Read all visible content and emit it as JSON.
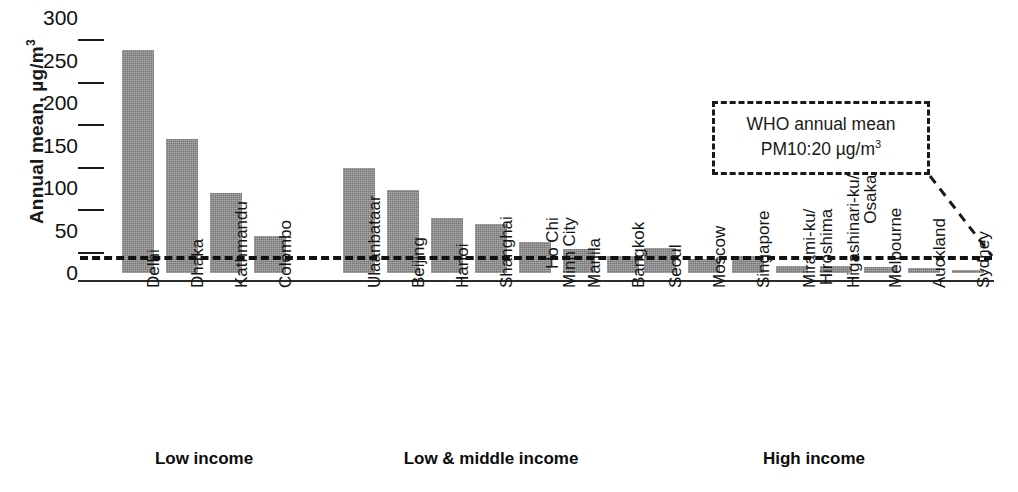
{
  "chart_data": {
    "type": "bar",
    "title": "",
    "xlabel": "",
    "ylabel": "Annual mean, µg/m",
    "ylabel_sup": "3",
    "ylim": [
      0,
      300
    ],
    "yticks": [
      0,
      50,
      100,
      150,
      200,
      250,
      300
    ],
    "grid": false,
    "legend": "none",
    "categories": [
      "Delhi",
      "Dhaka",
      "Kathmandu",
      "Colombo",
      "Ulaanbataar",
      "Beijing",
      "Hanoi",
      "Shanghai",
      "Ho Chi\nMinh City",
      "Manila",
      "Bangkok",
      "Seoul",
      "Moscow",
      "Singapore",
      "Mirami-ku/\nHiroshima",
      "Higashinari-ku/\nOsaka",
      "Melbourne",
      "Auckland",
      "Sydney"
    ],
    "values": [
      262,
      158,
      94,
      44,
      124,
      98,
      65,
      58,
      36,
      28,
      20,
      30,
      16,
      20,
      8,
      8,
      7,
      6,
      3
    ],
    "bar_color": "#919191",
    "groups": [
      {
        "label": "Low income",
        "start": 0,
        "count": 4
      },
      {
        "label": "Low & middle income",
        "start": 4,
        "count": 7
      },
      {
        "label": "High income",
        "start": 11,
        "count": 8
      }
    ],
    "annotations": [
      {
        "name": "who-guideline",
        "line1": "WHO annual mean",
        "line2_prefix": "PM10:20 µg/m",
        "line2_sup": "3",
        "value": 20,
        "style": "dashed-box-with-leader"
      }
    ],
    "reference_line": {
      "value": 20,
      "style": "dashed",
      "color": "#111111"
    }
  }
}
